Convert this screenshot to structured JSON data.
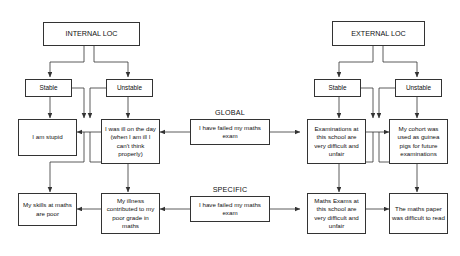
{
  "diagram": {
    "title_internal": "INTERNAL LOC",
    "title_external": "EXTERNAL LOC",
    "group_labels": {
      "global": "GLOBAL",
      "specific": "SPECIFIC"
    },
    "internal_branch": {
      "stable": "Stable",
      "unstable": "Unstable",
      "global_stable_outcome": "I am stupid",
      "global_unstable_outcome": "I was ill on the day (when I am ill I can't think properly)",
      "specific_stable_outcome": "My skills at maths are poor",
      "specific_unstable_outcome": "My illness contributed to my poor grade in maths"
    },
    "external_branch": {
      "stable": "Stable",
      "unstable": "Unstable",
      "global_stable_outcome": "Examinations at this school are very difficult and unfair",
      "global_unstable_outcome": "My cohort was used as guinea pigs for future examinations",
      "specific_stable_outcome": "Maths Exams at this school are very difficult and unfair",
      "specific_unstable_outcome": "The maths paper was difficult to read"
    },
    "center_events": {
      "global_event": "I have failed my maths exam",
      "specific_event": "I have failed my maths exam"
    },
    "colors": {
      "line": "#333333",
      "box_border": "#333333",
      "background": "#ffffff",
      "text": "#111111"
    }
  }
}
